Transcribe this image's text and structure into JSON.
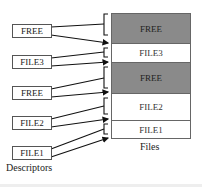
{
  "descriptors": {
    "label": "Descriptors",
    "items": [
      {
        "label": "FREE"
      },
      {
        "label": "FILE3"
      },
      {
        "label": "FREE"
      },
      {
        "label": "FILE2"
      },
      {
        "label": "FILE1"
      }
    ]
  },
  "files": {
    "label": "Files",
    "segments": [
      {
        "label": "FREE",
        "state": "free"
      },
      {
        "label": "FILE3",
        "state": "used"
      },
      {
        "label": "FREE",
        "state": "free"
      },
      {
        "label": "FILE2",
        "state": "used"
      },
      {
        "label": "FILE1",
        "state": "used"
      }
    ]
  },
  "colors": {
    "free_fill": "#8a8a8a",
    "used_fill": "#ffffff",
    "line": "#111111"
  }
}
